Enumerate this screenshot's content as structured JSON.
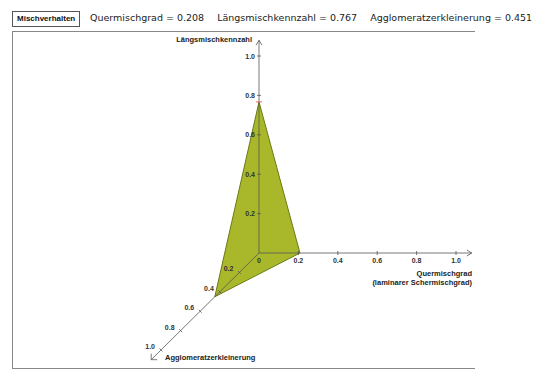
{
  "header": {
    "button_label": "Mischverhalten",
    "metrics": [
      {
        "label": "Quermischgrad",
        "value": "0.208",
        "text": "Quermischgrad = 0.208"
      },
      {
        "label": "Längsmischkennzahl",
        "value": "0.767",
        "text": "Längsmischkennzahl = 0.767"
      },
      {
        "label": "Agglomeratzerkleinerung",
        "value": "0.451",
        "text": "Agglomeratzerkleinerung = 0.451"
      }
    ]
  },
  "chart_data": {
    "type": "3d-triangle",
    "title": "",
    "axes": {
      "x": {
        "label_line1": "Quermischgrad",
        "label_line2": "(laminarer Schermischgrad)",
        "range": [
          0,
          1.0
        ],
        "ticks": [
          "0",
          "0.2",
          "0.4",
          "0.6",
          "0.8",
          "1.0"
        ]
      },
      "y": {
        "label": "Längsmischkennzahl",
        "range": [
          0,
          1.0
        ],
        "ticks": [
          "0.2",
          "0.4",
          "0.6",
          "0.8",
          "1.0"
        ]
      },
      "z": {
        "label": "Agglomeratzerkleinerung",
        "range": [
          0,
          1.0
        ],
        "ticks": [
          "0.2",
          "0.4",
          "0.6",
          "0.8",
          "1.0"
        ]
      }
    },
    "values": {
      "x": 0.208,
      "y": 0.767,
      "z": 0.451
    },
    "fill_color": "#a8b82a",
    "edge_color": "#6b7a10",
    "marker_color": "#e06a6a"
  }
}
